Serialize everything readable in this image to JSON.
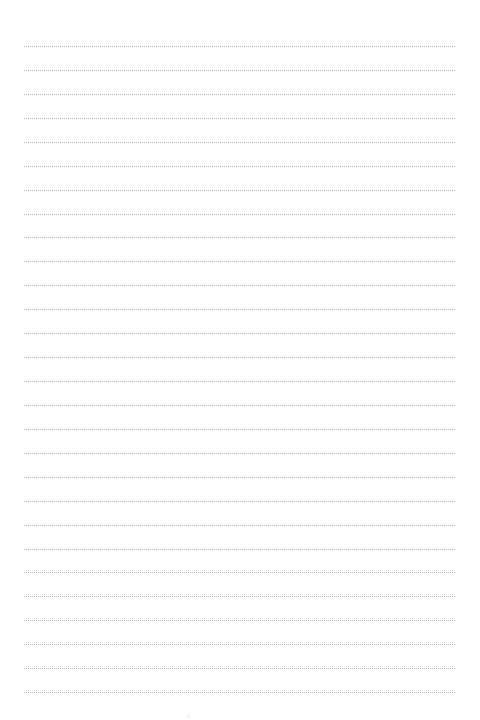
{
  "page": {
    "type": "ruled-notebook-page",
    "background_color": "#ffffff",
    "rule_color": "#b5b5b5",
    "rule_style": "dotted",
    "rule_count": 28,
    "rule_left": 24,
    "rule_right": 455,
    "first_rule_y": 46,
    "rule_spacing": 23.93
  }
}
